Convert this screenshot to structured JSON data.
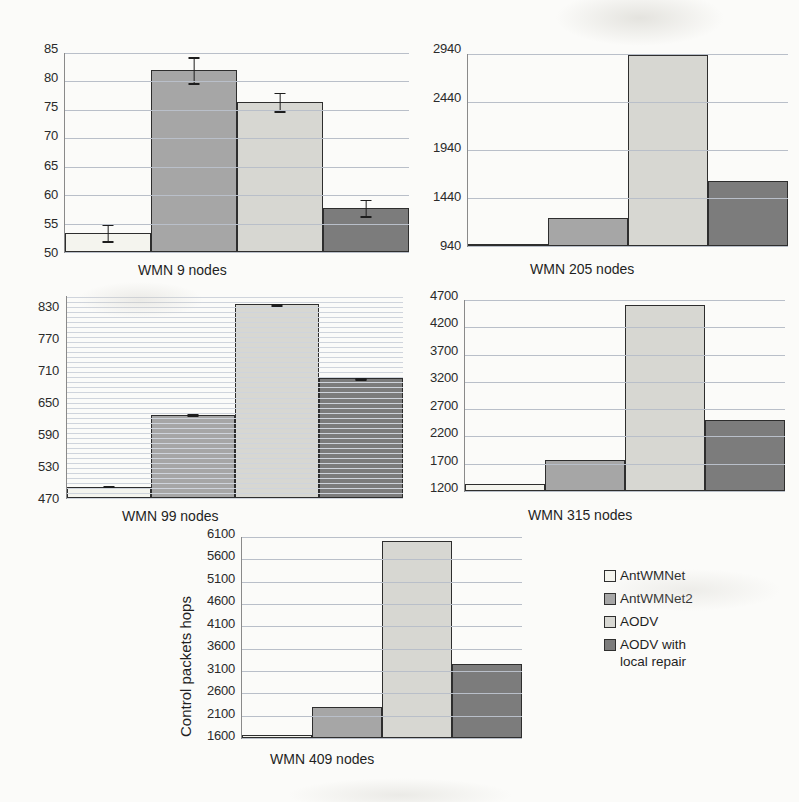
{
  "figure": {
    "series_names": [
      "AntWMNet",
      "AntWMNet2",
      "AODV",
      "AODV with\nlocal repair"
    ],
    "series_colors": [
      "#f4f4ee",
      "#a6a6a6",
      "#d7d7d2",
      "#7c7c7c"
    ],
    "y_axis_label": "Control packets hops"
  },
  "legend": {
    "items": [
      {
        "label": "AntWMNet",
        "color": "#f4f4ee"
      },
      {
        "label": "AntWMNet2",
        "color": "#a6a6a6"
      },
      {
        "label": "AODV",
        "color": "#d7d7d2"
      },
      {
        "label": "AODV with\nlocal repair",
        "color": "#7c7c7c"
      }
    ]
  },
  "panels": [
    {
      "id": "wmn-9-nodes",
      "caption": "WMN 9 nodes",
      "ticks": [
        "85",
        "80",
        "75",
        "70",
        "65",
        "60",
        "55",
        "50"
      ],
      "values": [
        53.4,
        82.0,
        76.4,
        57.8
      ],
      "errors": [
        1.6,
        2.4,
        1.8,
        1.6
      ],
      "ymin": 50,
      "ymax": 85
    },
    {
      "id": "wmn-205-nodes",
      "caption": "WMN 205 nodes",
      "ticks": [
        "2940",
        "2440",
        "1940",
        "1440",
        "940"
      ],
      "values": [
        950,
        1230,
        2930,
        1615
      ],
      "errors": [
        0,
        0,
        0,
        0
      ],
      "ymin": 940,
      "ymax": 2940
    },
    {
      "id": "wmn-99-nodes",
      "caption": "WMN 99 nodes",
      "ticks": [
        "830",
        "770",
        "710",
        "650",
        "590",
        "530",
        "470"
      ],
      "values": [
        492,
        636,
        856,
        708
      ],
      "errors": [
        3,
        3,
        3,
        3
      ],
      "ymin": 470,
      "ymax": 872
    },
    {
      "id": "wmn-315-nodes",
      "caption": "WMN 315 nodes",
      "ticks": [
        "4700",
        "4200",
        "3700",
        "3200",
        "2700",
        "2200",
        "1700",
        "1200"
      ],
      "values": [
        1320,
        1770,
        4600,
        2510
      ],
      "errors": [
        0,
        0,
        0,
        0
      ],
      "ymin": 1200,
      "ymax": 4700
    },
    {
      "id": "wmn-409-nodes",
      "caption": "WMN 409 nodes",
      "ticks": [
        "6100",
        "5600",
        "5100",
        "4600",
        "4100",
        "3600",
        "3100",
        "2600",
        "2100",
        "1600"
      ],
      "values": [
        1660,
        2300,
        6010,
        3250
      ],
      "errors": [
        0,
        0,
        0,
        0
      ],
      "ymin": 1600,
      "ymax": 6100
    }
  ],
  "chart_data": {
    "type": "bar",
    "title": "",
    "xlabel": "",
    "ylabel": "Control packets hops",
    "grid": true,
    "legend_position": "right",
    "categories": [
      "AntWMNet",
      "AntWMNet2",
      "AODV",
      "AODV with local repair"
    ],
    "panels": [
      {
        "name": "WMN 9 nodes",
        "ylim": [
          50,
          85
        ],
        "yticks": [
          50,
          55,
          60,
          65,
          70,
          75,
          80,
          85
        ],
        "values": [
          53.4,
          82.0,
          76.4,
          57.8
        ],
        "errors": [
          1.6,
          2.4,
          1.8,
          1.6
        ]
      },
      {
        "name": "WMN 205 nodes",
        "ylim": [
          940,
          2940
        ],
        "yticks": [
          940,
          1440,
          1940,
          2440,
          2940
        ],
        "values": [
          950,
          1230,
          2930,
          1615
        ],
        "errors": [
          0,
          0,
          0,
          0
        ]
      },
      {
        "name": "WMN 99 nodes",
        "ylim": [
          470,
          872
        ],
        "yticks": [
          470,
          530,
          590,
          650,
          710,
          770,
          830
        ],
        "values": [
          492,
          636,
          856,
          708
        ],
        "errors": [
          3,
          3,
          3,
          3
        ]
      },
      {
        "name": "WMN 315 nodes",
        "ylim": [
          1200,
          4700
        ],
        "yticks": [
          1200,
          1700,
          2200,
          2700,
          3200,
          3700,
          4200,
          4700
        ],
        "values": [
          1320,
          1770,
          4600,
          2510
        ],
        "errors": [
          0,
          0,
          0,
          0
        ]
      },
      {
        "name": "WMN 409 nodes",
        "ylim": [
          1600,
          6100
        ],
        "yticks": [
          1600,
          2100,
          2600,
          3100,
          3600,
          4100,
          4600,
          5100,
          5600,
          6100
        ],
        "values": [
          1660,
          2300,
          6010,
          3250
        ],
        "errors": [
          0,
          0,
          0,
          0
        ]
      }
    ]
  }
}
